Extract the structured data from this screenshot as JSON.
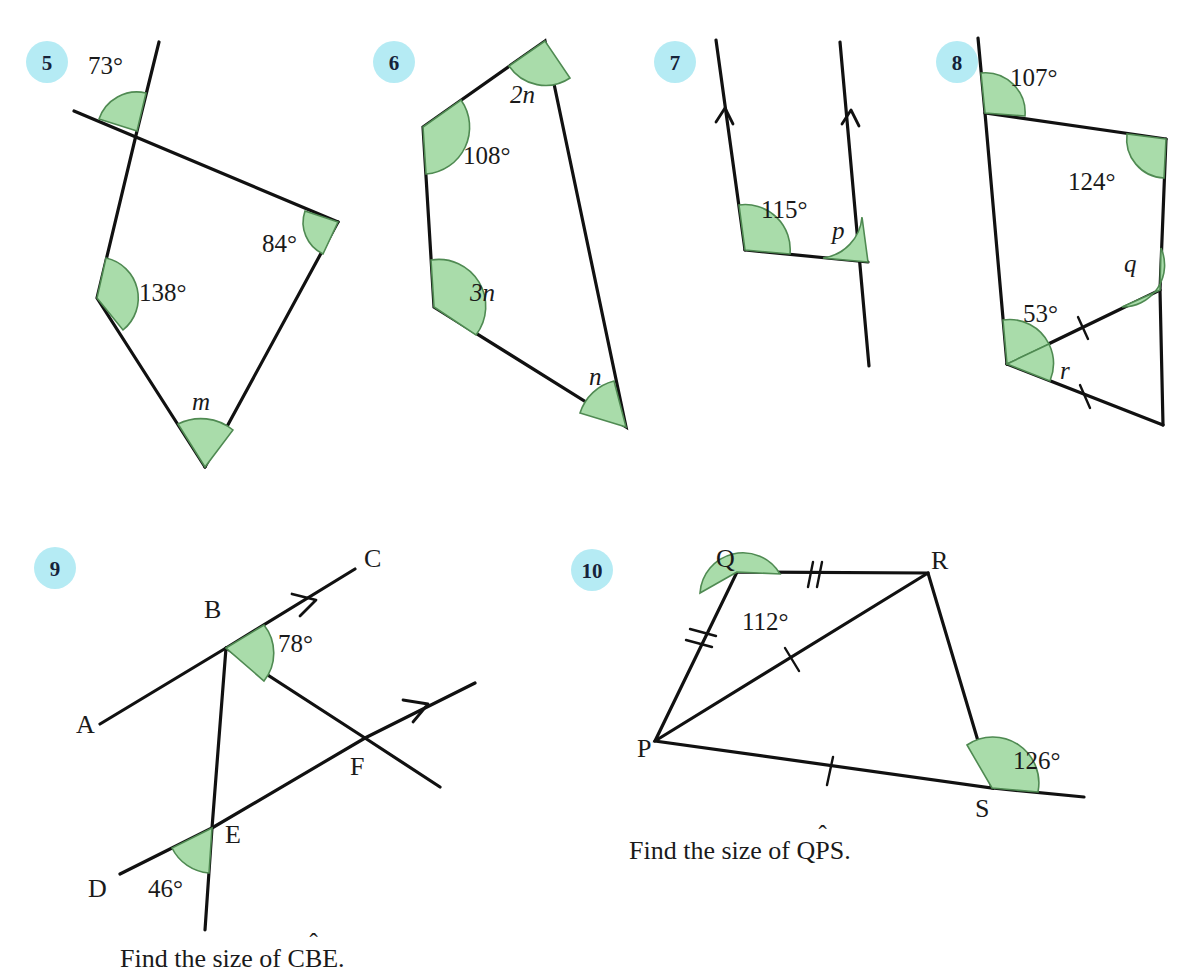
{
  "page": {
    "background": "#ffffff",
    "badge_color": "#b5ebf4",
    "angle_fill_color": "#a9dcaa",
    "angle_stroke_color": "#4f8a52",
    "line_color": "#111111"
  },
  "problems": [
    {
      "number": "5",
      "shape": "quadrilateral with one side extended",
      "angle_labels": [
        "73°",
        "84°",
        "138°",
        "m"
      ],
      "unknowns": [
        "m"
      ],
      "known_angles": [
        "73°",
        "84°",
        "138°"
      ]
    },
    {
      "number": "6",
      "shape": "quadrilateral",
      "angle_labels": [
        "2n",
        "108°",
        "3n",
        "n"
      ],
      "unknowns": [
        "n",
        "2n",
        "3n"
      ],
      "known_angles": [
        "108°"
      ]
    },
    {
      "number": "7",
      "shape": "two parallel lines cut by a transversal",
      "angle_labels": [
        "115°",
        "p"
      ],
      "unknowns": [
        "p"
      ],
      "known_angles": [
        "115°"
      ]
    },
    {
      "number": "8",
      "shape": "quadrilateral with extended side and triangle",
      "angle_labels": [
        "107°",
        "124°",
        "q",
        "53°",
        "r"
      ],
      "unknowns": [
        "q",
        "r"
      ],
      "known_angles": [
        "107°",
        "124°",
        "53°"
      ]
    },
    {
      "number": "9",
      "shape": "two parallel lines with transversals",
      "point_labels": [
        "A",
        "B",
        "C",
        "D",
        "E",
        "F"
      ],
      "angle_labels": [
        "78°",
        "46°"
      ],
      "known_angles": [
        "78°",
        "46°"
      ],
      "caption_prefix": "Find the size of C",
      "caption_hat_letter": "B",
      "caption_suffix": "E."
    },
    {
      "number": "10",
      "shape": "quadrilateral PQRS with diagonal PR and side PS extended",
      "point_labels": [
        "P",
        "Q",
        "R",
        "S"
      ],
      "angle_labels": [
        "112°",
        "126°"
      ],
      "known_angles": [
        "112°",
        "126°"
      ],
      "tick_marks": "PQ and QR double ticks; PR and PS single ticks",
      "caption_prefix": "Find the size of Q",
      "caption_hat_letter": "P",
      "caption_suffix": "S."
    }
  ],
  "labels": {
    "q5": {
      "a73": "73°",
      "a84": "84°",
      "a138": "138°",
      "m": "m",
      "num": "5"
    },
    "q6": {
      "a2n": "2n",
      "a108": "108°",
      "a3n": "3n",
      "n": "n",
      "num": "6"
    },
    "q7": {
      "a115": "115°",
      "p": "p",
      "num": "7"
    },
    "q8": {
      "a107": "107°",
      "a124": "124°",
      "q": "q",
      "a53": "53°",
      "r": "r",
      "num": "8"
    },
    "q9": {
      "num": "9",
      "A": "A",
      "B": "B",
      "C": "C",
      "D": "D",
      "E": "E",
      "F": "F",
      "a78": "78°",
      "a46": "46°",
      "caption_prefix": "Find the size of C",
      "caption_hat": "ˆ",
      "caption_hat_letter": "B",
      "caption_suffix": "E."
    },
    "q10": {
      "num": "10",
      "P": "P",
      "Q": "Q",
      "R": "R",
      "S": "S",
      "a112": "112°",
      "a126": "126°",
      "caption_prefix": "Find the size of Q",
      "caption_hat": "ˆ",
      "caption_hat_letter": "P",
      "caption_suffix": "S."
    }
  }
}
